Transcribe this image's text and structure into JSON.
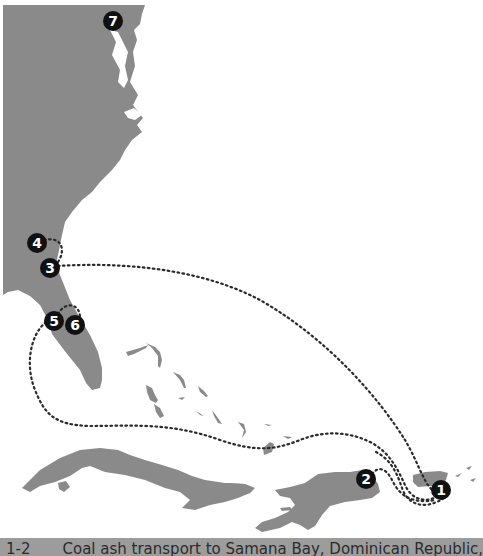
{
  "map": {
    "title": "Coal ash transport routes — US East Coast to Caribbean",
    "land_color": "#8a8a8a",
    "route_color": "#2a2a2a",
    "marker_color": "#111111",
    "regions": [
      "US East Coast",
      "Florida",
      "Bahamas",
      "Cuba",
      "Jamaica",
      "Hispaniola",
      "Puerto Rico"
    ],
    "markers": [
      {
        "id": "1",
        "label": "1",
        "x": 441,
        "y": 490
      },
      {
        "id": "2",
        "label": "2",
        "x": 366,
        "y": 479
      },
      {
        "id": "3",
        "label": "3",
        "x": 50,
        "y": 268
      },
      {
        "id": "4",
        "label": "4",
        "x": 37,
        "y": 243
      },
      {
        "id": "5",
        "label": "5",
        "x": 54,
        "y": 321
      },
      {
        "id": "6",
        "label": "6",
        "x": 75,
        "y": 325
      },
      {
        "id": "7",
        "label": "7",
        "x": 113,
        "y": 21
      }
    ]
  },
  "caption": {
    "number": "1-2",
    "text": "Coal ash transport to Samana Bay, Dominican Republic,",
    "background": "#9c9c9c"
  }
}
